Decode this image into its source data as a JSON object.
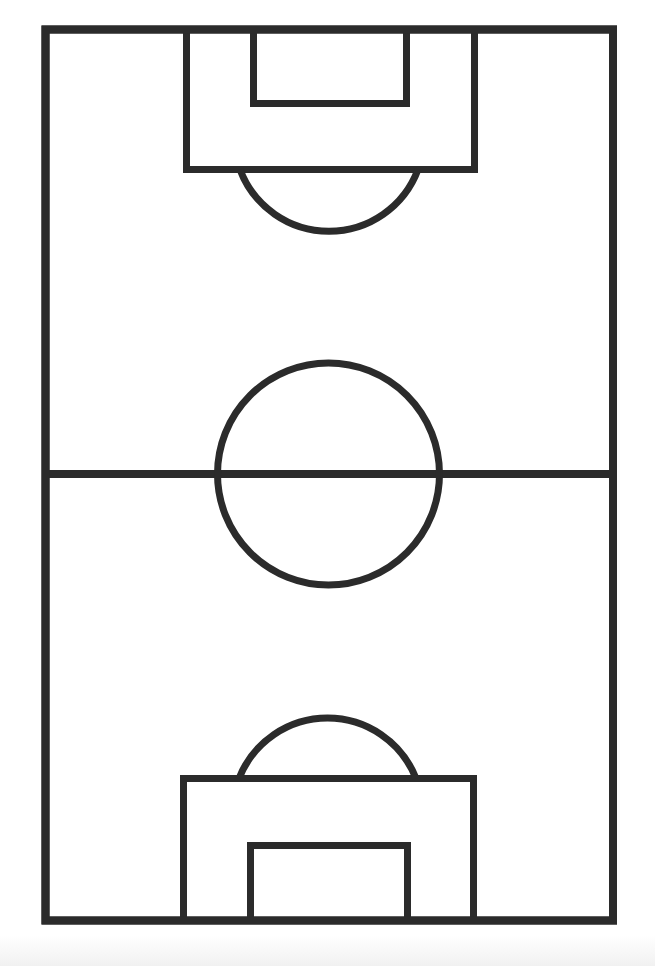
{
  "diagram": {
    "title": "Soccer pitch",
    "line_color": "#2b2b2b",
    "background_color": "#ffffff",
    "line_width": 8,
    "boundary": {
      "x": 45.5,
      "y": 29.5,
      "width": 567.5,
      "height": 891
    },
    "halfway_line": {
      "x1": 45.5,
      "y": 474,
      "x2": 613
    },
    "center_circle": {
      "cx": 328.5,
      "cy": 474,
      "r": 111
    },
    "top_penalty_area": {
      "x": 186.5,
      "y": 29.5,
      "width": 288,
      "height": 140
    },
    "top_goal_area": {
      "x": 253.5,
      "y": 29.5,
      "width": 153,
      "height": 74
    },
    "top_penalty_arc": {
      "x1": 240,
      "x2": 418,
      "y": 169.5,
      "r": 95
    },
    "bottom_penalty_area": {
      "x": 183.5,
      "y": 778.5,
      "width": 290,
      "height": 142
    },
    "bottom_goal_area": {
      "x": 250.5,
      "y": 845.5,
      "width": 157,
      "height": 75
    },
    "bottom_penalty_arc": {
      "x1": 239,
      "x2": 416,
      "y": 778.5,
      "r": 95
    }
  }
}
